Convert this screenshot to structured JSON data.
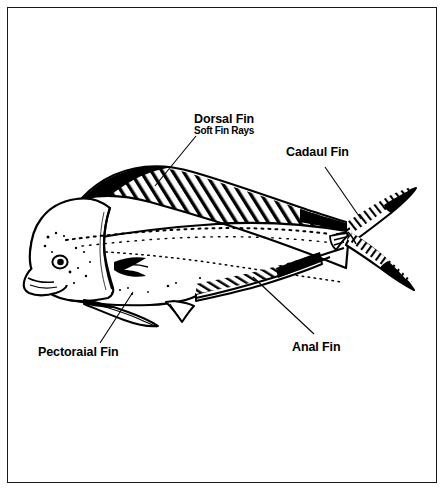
{
  "page": {
    "background_color": "#ffffff",
    "ink_color": "#000000",
    "border_color": "#1a1a1a"
  },
  "labels": {
    "dorsal": {
      "title": "Dorsal Fin",
      "subtitle": "Soft Fin Rays"
    },
    "caudal": {
      "title": "Cadaul Fin"
    },
    "pectoral": {
      "title": "Pectoraial Fin"
    },
    "anal": {
      "title": "Anal Fin"
    }
  },
  "leader_lines": [
    {
      "name": "dorsal-leader",
      "from": [
        196,
        136
      ],
      "to": [
        155,
        186
      ]
    },
    {
      "name": "caudal-leader",
      "from": [
        325,
        167
      ],
      "to": [
        361,
        219
      ]
    },
    {
      "name": "pectoral-leader",
      "from": [
        133,
        292
      ],
      "to": [
        100,
        343
      ]
    },
    {
      "name": "anal-leader",
      "from": [
        253,
        277
      ],
      "to": [
        314,
        334
      ]
    }
  ],
  "figure_parts": [
    "head",
    "eye",
    "mouth",
    "gill-cover",
    "body",
    "lateral-line",
    "dorsal-fin",
    "pectoral-fin",
    "pelvic-fin",
    "anal-fin",
    "caudal-fin",
    "caudal-peduncle"
  ]
}
